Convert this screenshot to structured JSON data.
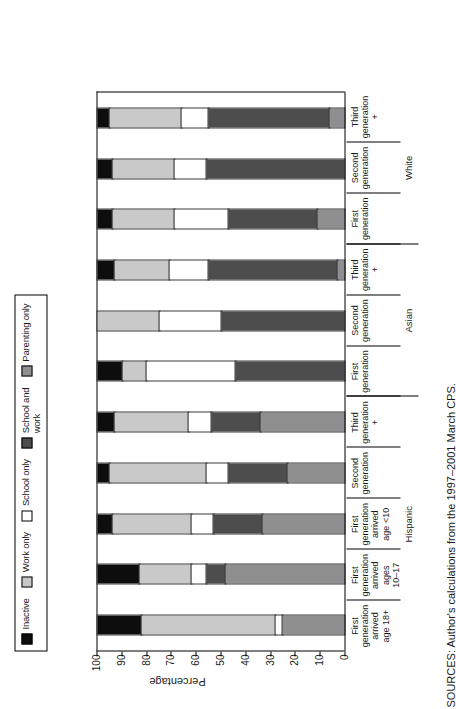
{
  "chart_data": {
    "type": "bar",
    "subtype": "stacked-bar-100",
    "orientation": "vertical-bars-rotated-90ccw",
    "title": "",
    "xlabel": "",
    "ylabel": "Percentage",
    "ylim": [
      0,
      100
    ],
    "yticks": [
      100,
      90,
      80,
      70,
      60,
      50,
      40,
      30,
      20,
      10,
      0
    ],
    "grid": false,
    "legend_position": "top-left",
    "legend": [
      "Inactive",
      "Work only",
      "School only",
      "School and work",
      "Parenting only"
    ],
    "colors": {
      "Inactive": "#0d0d0d",
      "Work only": "#c9c9c9",
      "School only": "#ffffff",
      "School and work": "#4d4d4d",
      "Parenting only": "#8f8f8f"
    },
    "categories": [
      "First generation arrived age 18+",
      "First generation arrived ages 10–17",
      "First generation arrived age <10",
      "Second generation",
      "Third generation +",
      "First generation",
      "Second generation",
      "Third generation +",
      "First generation",
      "Second generation",
      "Third generation +"
    ],
    "groups": [
      {
        "label": "Hispanic",
        "span": 5
      },
      {
        "label": "Asian",
        "span": 3
      },
      {
        "label": "White",
        "span": 3
      }
    ],
    "series": [
      {
        "name": "Inactive",
        "values": [
          18,
          17,
          6,
          5,
          7,
          10,
          0,
          7,
          6,
          6,
          5
        ]
      },
      {
        "name": "Work only",
        "values": [
          54,
          21,
          32,
          39,
          30,
          10,
          25,
          22,
          25,
          25,
          29
        ]
      },
      {
        "name": "School only",
        "values": [
          3,
          6,
          9,
          9,
          9,
          36,
          25,
          16,
          22,
          13,
          11
        ]
      },
      {
        "name": "School and work",
        "values": [
          0,
          8,
          20,
          24,
          20,
          44,
          50,
          52,
          36,
          56,
          49
        ]
      },
      {
        "name": "Parenting only",
        "values": [
          25,
          48,
          33,
          23,
          34,
          0,
          0,
          3,
          11,
          0,
          6
        ]
      }
    ]
  },
  "legend": {
    "items": [
      {
        "label": "Inactive",
        "color": "#0d0d0d",
        "swatch_name": "legend-swatch-inactive"
      },
      {
        "label": "Work only",
        "color": "#c9c9c9",
        "swatch_name": "legend-swatch-work-only"
      },
      {
        "label": "School only",
        "color": "#ffffff",
        "swatch_name": "legend-swatch-school-only"
      },
      {
        "label": "School and\nwork",
        "color": "#4d4d4d",
        "swatch_name": "legend-swatch-school-and-work"
      },
      {
        "label": "Parenting only",
        "color": "#8f8f8f",
        "swatch_name": "legend-swatch-parenting-only"
      }
    ]
  },
  "axis": {
    "y_label": "Percentage",
    "y_ticks": [
      "100",
      "90",
      "80",
      "70",
      "60",
      "50",
      "40",
      "30",
      "20",
      "10",
      "0"
    ]
  },
  "category_labels": [
    "First\ngeneration\narrived\nage 18+",
    "First\ngeneration\narrived\nages\n10–17",
    "First\ngeneration\narrived\nage <10",
    "Second\ngeneration",
    "Third\ngeneration\n+",
    "First\ngeneration",
    "Second\ngeneration",
    "Third\ngeneration\n+",
    "First\ngeneration",
    "Second\ngeneration",
    "Third\ngeneration\n+"
  ],
  "group_labels": [
    "Hispanic",
    "Asian",
    "White"
  ],
  "source_note": "SOURCES: Author's calculations from the 1997–2001 March CPS."
}
